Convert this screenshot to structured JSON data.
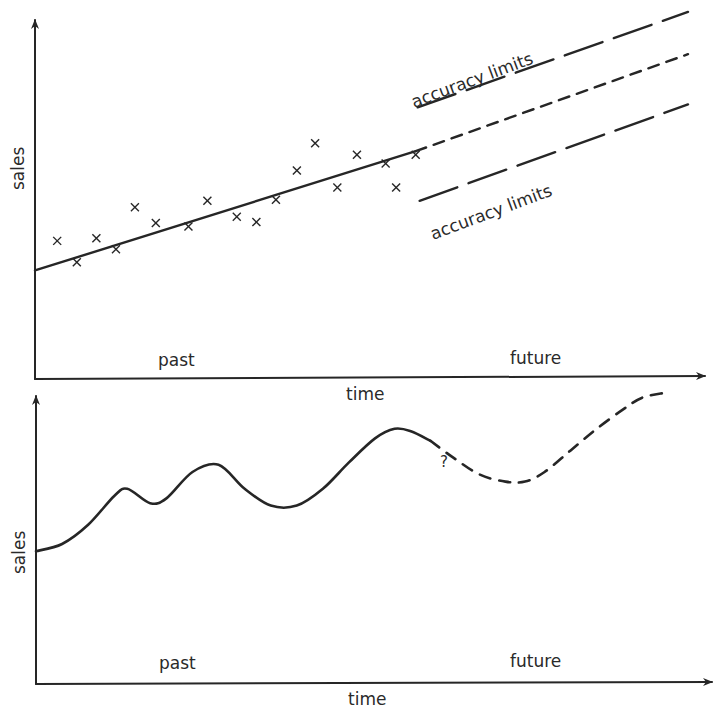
{
  "ink_color": "#262626",
  "chart_data": [
    {
      "type": "scatter",
      "title": "",
      "xlabel": "time",
      "ylabel": "sales",
      "region_labels": {
        "past": "past",
        "future": "future"
      },
      "grid": false,
      "xlim": [
        0,
        100
      ],
      "ylim": [
        0,
        100
      ],
      "points": [
        {
          "x": 3.4,
          "y": 29.6
        },
        {
          "x": 6.4,
          "y": 22.9
        },
        {
          "x": 9.4,
          "y": 30.4
        },
        {
          "x": 12.4,
          "y": 27.0
        },
        {
          "x": 15.3,
          "y": 40.2
        },
        {
          "x": 18.5,
          "y": 35.2
        },
        {
          "x": 23.5,
          "y": 34.1
        },
        {
          "x": 26.4,
          "y": 42.2
        },
        {
          "x": 30.9,
          "y": 37.2
        },
        {
          "x": 33.9,
          "y": 35.5
        },
        {
          "x": 36.9,
          "y": 42.5
        },
        {
          "x": 40.1,
          "y": 51.7
        },
        {
          "x": 42.9,
          "y": 60.3
        },
        {
          "x": 46.3,
          "y": 46.4
        },
        {
          "x": 49.3,
          "y": 56.7
        },
        {
          "x": 53.7,
          "y": 53.9
        },
        {
          "x": 55.3,
          "y": 46.4
        },
        {
          "x": 58.3,
          "y": 56.7
        }
      ],
      "trend_line": {
        "x": [
          0,
          58.3
        ],
        "y": [
          20.3,
          57.8
        ],
        "style": "solid"
      },
      "forecast_line": {
        "x": [
          58.3,
          100
        ],
        "y": [
          57.8,
          88.3
        ],
        "style": "dashed"
      },
      "upper_limit": {
        "x": [
          58.6,
          100
        ],
        "y": [
          71.6,
          101.6
        ],
        "style": "long-dash",
        "label": "accuracy limits"
      },
      "lower_limit": {
        "x": [
          58.9,
          100
        ],
        "y": [
          42.2,
          72.5
        ],
        "style": "long-dash",
        "label": "accuracy limits"
      }
    },
    {
      "type": "line",
      "title": "",
      "xlabel": "time",
      "ylabel": "sales",
      "region_labels": {
        "past": "past",
        "future": "future"
      },
      "annotation": "?",
      "grid": false,
      "xlim": [
        0,
        100
      ],
      "ylim": [
        0,
        100
      ],
      "past_series": {
        "name": "actual sales",
        "style": "solid",
        "x": [
          0,
          4,
          8,
          12,
          14,
          17.5,
          20,
          24,
          28,
          32,
          36,
          40,
          44,
          48,
          52,
          55,
          57.5,
          60.5
        ],
        "y": [
          37,
          40,
          48,
          60,
          63,
          57,
          59,
          70,
          73,
          63,
          56,
          56,
          63,
          74,
          84,
          88,
          87,
          83
        ]
      },
      "future_series": {
        "name": "forecast",
        "style": "dashed",
        "x": [
          60.5,
          64,
          68,
          72,
          75,
          78,
          82,
          86,
          90,
          93,
          96.5
        ],
        "y": [
          83,
          76,
          69,
          66,
          66,
          70,
          79,
          88,
          96,
          101,
          103
        ]
      }
    }
  ]
}
